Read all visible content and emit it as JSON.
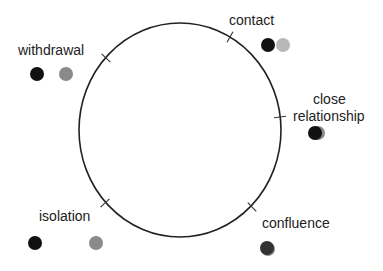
{
  "diagram": {
    "circle": {
      "cx": 180,
      "cy": 130,
      "rx": 101,
      "ry": 107,
      "stroke": "#222222"
    },
    "stages": [
      {
        "id": "withdrawal",
        "label": "withdrawal",
        "label_pos": [
          18,
          55
        ],
        "tick": [
          106,
          58
        ],
        "dots": [
          {
            "x": 37,
            "y": 74,
            "color": "#111111"
          },
          {
            "x": 66,
            "y": 74,
            "color": "#8a8a8a"
          }
        ]
      },
      {
        "id": "contact",
        "label": "contact",
        "label_pos": [
          229,
          25
        ],
        "tick": [
          230,
          37
        ],
        "dots": [
          {
            "x": 283,
            "y": 45,
            "color": "#b8b8b8"
          },
          {
            "x": 268,
            "y": 45,
            "color": "#111111"
          }
        ]
      },
      {
        "id": "close-relationship",
        "label_lines": [
          "close",
          "relationship"
        ],
        "label_pos": [
          313,
          104
        ],
        "label_pos2": [
          293,
          121
        ],
        "tick": [
          280,
          117
        ],
        "dots": [
          {
            "x": 318,
            "y": 133,
            "color": "#8a8a8a"
          },
          {
            "x": 315,
            "y": 133,
            "color": "#111111"
          }
        ]
      },
      {
        "id": "isolation",
        "label": "isolation",
        "label_pos": [
          39,
          221
        ],
        "tick": [
          105,
          203
        ],
        "dots": [
          {
            "x": 35,
            "y": 243,
            "color": "#111111"
          },
          {
            "x": 96,
            "y": 243,
            "color": "#8a8a8a"
          }
        ]
      },
      {
        "id": "confluence",
        "label": "confluence",
        "label_pos": [
          262,
          228
        ],
        "tick": [
          252,
          207
        ],
        "dots": [
          {
            "x": 268,
            "y": 249,
            "color": "#8a8a8a"
          },
          {
            "x": 267,
            "y": 248,
            "color": "#333333"
          }
        ]
      }
    ],
    "dot_radius": 7
  }
}
